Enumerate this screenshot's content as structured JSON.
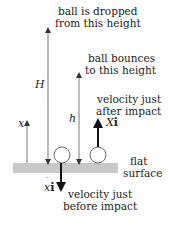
{
  "labels": {
    "dropped": [
      "ball is dropped",
      "from this height"
    ],
    "bounces": [
      "ball bounces",
      "to this height"
    ],
    "after": [
      "velocity just",
      "after impact"
    ],
    "before": [
      "velocity just",
      "before impact"
    ],
    "surface": [
      "flat",
      "surface"
    ]
  },
  "symbols": {
    "H": "H",
    "h": "h",
    "x": "x",
    "v_after_var": "X",
    "v_after_unit": "i",
    "v_before_var": "x",
    "v_before_unit": "i"
  },
  "colors": {
    "surface": "#c8c8c8",
    "thin_line": "#555555",
    "thick_arrow": "#111111",
    "ball_fill": "#ffffff",
    "ball_stroke": "#444444"
  }
}
